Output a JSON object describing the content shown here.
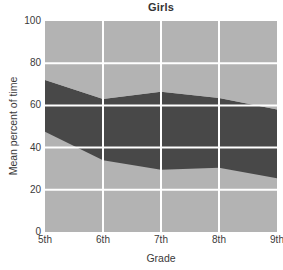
{
  "chart_data": {
    "type": "area",
    "title": "Girls",
    "xlabel": "Grade",
    "ylabel": "Mean percent of time",
    "categories": [
      "5th",
      "6th",
      "7th",
      "8th",
      "9th"
    ],
    "x_positions": [
      0,
      1,
      2,
      3,
      4
    ],
    "ylim": [
      0,
      100
    ],
    "xlim": [
      0,
      4
    ],
    "y_ticks": [
      0,
      20,
      40,
      60,
      80,
      100
    ],
    "y_tick_labels": [
      "0",
      "20",
      "40",
      "60",
      "80",
      "100"
    ],
    "x_tick_labels": [
      "5th",
      "6th",
      "7th",
      "8th",
      "9th"
    ],
    "grid": true,
    "grid_color": "#ffffff",
    "legend": "none",
    "stacked": true,
    "series": [
      {
        "name": "lower-light-band",
        "color": "#b3b3b3",
        "boundary_top": [
          47.5,
          34.0,
          29.5,
          30.5,
          25.5
        ],
        "boundary_bottom": [
          0,
          0,
          0,
          0,
          0
        ],
        "values": [
          47.5,
          34.0,
          29.5,
          30.5,
          25.5
        ]
      },
      {
        "name": "middle-dark-band",
        "color": "#484848",
        "boundary_top": [
          72.0,
          63.0,
          66.5,
          63.5,
          58.0
        ],
        "boundary_bottom": [
          47.5,
          34.0,
          29.5,
          30.5,
          25.5
        ],
        "values": [
          24.5,
          29.0,
          37.0,
          33.0,
          32.5
        ]
      },
      {
        "name": "upper-light-band",
        "color": "#b3b3b3",
        "boundary_top": [
          100,
          100,
          100,
          100,
          100
        ],
        "boundary_bottom": [
          72.0,
          63.0,
          66.5,
          63.5,
          58.0
        ],
        "values": [
          28.0,
          37.0,
          33.5,
          36.5,
          42.0
        ]
      }
    ],
    "plot_background": "#b3b3b3"
  },
  "figure": {
    "background": "#ffffff",
    "axis_text_color": "#3a3a3a",
    "title_color": "#333333"
  }
}
